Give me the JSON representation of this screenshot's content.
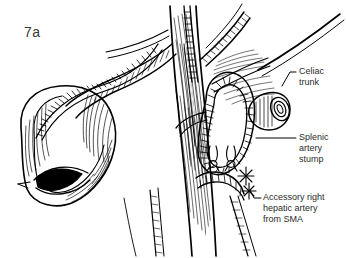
{
  "figure": {
    "label": "7a",
    "domain": "surgical-anatomy-illustration",
    "style": "pen-and-ink line drawing, black on white, cross-hatch shading",
    "background_color": "#ffffff",
    "ink_color": "#000000",
    "text_color": "#2b2b2b"
  },
  "callouts": [
    {
      "id": "celiac-trunk",
      "text": "Celiac\ntrunk",
      "lines": [
        "Celiac",
        "trunk"
      ],
      "leader": "short hooked line from text left to cut celiac trunk ring at upper right"
    },
    {
      "id": "splenic-artery-stump",
      "text": "Splenic\nartery\nstump",
      "lines": [
        "Splenic",
        "artery",
        "stump"
      ],
      "leader": "horizontal line from text left to sutured vessel stump at mid right"
    },
    {
      "id": "accessory-right-hepatic-artery",
      "text": "Accessory right\nhepatic artery\nfrom SMA",
      "lines": [
        "Accessory right",
        "hepatic artery",
        "from SMA"
      ],
      "leader": "short hooked line from text left up to looped artery"
    }
  ],
  "anatomy": {
    "structures": [
      "duodenum C-loop with open transected lumen (left)",
      "aorta / main vascular trunk (center, vertical)",
      "branching arterial tree (center-upper)",
      "celiac trunk cut end showing lumen ring (upper right)",
      "splenic artery stump with ligature suture (mid right)",
      "accessory right hepatic artery from SMA, looped (right)",
      "surgical clips / ties on small vessel branches"
    ]
  }
}
